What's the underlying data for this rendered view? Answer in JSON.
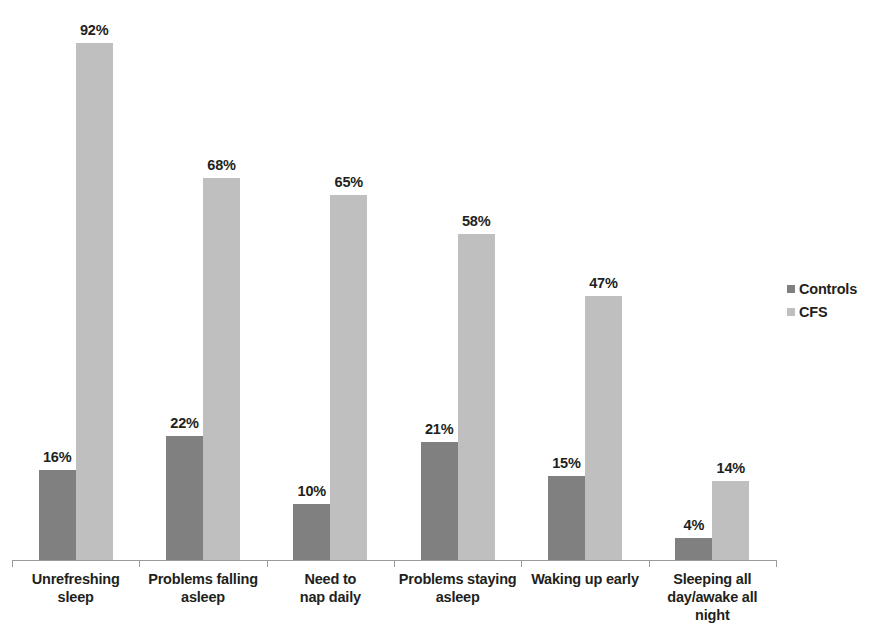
{
  "chart_data": {
    "type": "bar",
    "title": "",
    "subtitle": "",
    "xlabel": "",
    "ylabel": "",
    "ylim": [
      0,
      100
    ],
    "grid": false,
    "legend_position": "right",
    "value_label_suffix": "%",
    "categories": [
      "Unrefreshing sleep",
      "Problems falling asleep",
      "Need to nap daily",
      "Problems staying asleep",
      "Waking up early",
      "Sleeping all day/awake all night"
    ],
    "category_lines": [
      [
        "Unrefreshing",
        "sleep"
      ],
      [
        "Problems falling",
        "asleep"
      ],
      [
        "Need to",
        "nap daily"
      ],
      [
        "Problems staying",
        "asleep"
      ],
      [
        "Waking up early"
      ],
      [
        "Sleeping all",
        "day/awake all",
        "night"
      ]
    ],
    "series": [
      {
        "name": "Controls",
        "color": "#808080",
        "values": [
          16,
          22,
          10,
          21,
          15,
          4
        ],
        "labels": [
          "16%",
          "22%",
          "10%",
          "21%",
          "15%",
          "4%"
        ]
      },
      {
        "name": "CFS",
        "color": "#bfbfbf",
        "values": [
          92,
          68,
          65,
          58,
          47,
          14
        ],
        "labels": [
          "92%",
          "68%",
          "65%",
          "58%",
          "47%",
          "14%"
        ]
      }
    ]
  },
  "legend": {
    "items": [
      {
        "label": "Controls",
        "marker": "square-swatch-dark"
      },
      {
        "label": "CFS",
        "marker": "square-swatch-light"
      }
    ]
  }
}
